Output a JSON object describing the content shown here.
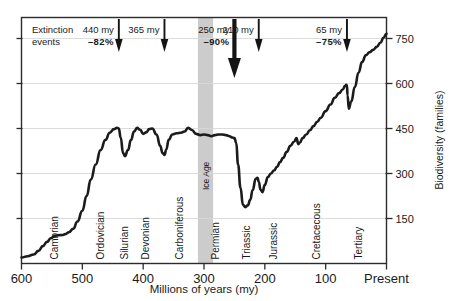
{
  "figure": {
    "name": "biodiversity-vs-geological-time",
    "axis_title_x": "Millions  of  years (my)",
    "axis_title_y": "Biodiversity (families)"
  },
  "annotations": {
    "group_label_line1": "Extinction",
    "group_label_line2": "events",
    "events": [
      {
        "id": "ext-440",
        "my": "440 my",
        "pct": "–82%",
        "x_my": 440,
        "major": false
      },
      {
        "id": "ext-365",
        "my": "365 my",
        "pct": "",
        "x_my": 365,
        "major": false
      },
      {
        "id": "ext-250",
        "my": "250 my",
        "pct": "–90%",
        "x_my": 250,
        "major": true
      },
      {
        "id": "ext-210",
        "my": "210 my",
        "pct": "",
        "x_my": 210,
        "major": false
      },
      {
        "id": "ext-65",
        "my": "65 my",
        "pct": "–75%",
        "x_my": 65,
        "major": false
      }
    ]
  },
  "bands": [
    {
      "id": "ice-age",
      "label": "Ice Age",
      "from_my": 310,
      "to_my": 285,
      "color": "#cccccc"
    }
  ],
  "periods": [
    {
      "label": "Cambrian",
      "x_my": 540
    },
    {
      "label": "Ordovician",
      "x_my": 465
    },
    {
      "label": "Silurian",
      "x_my": 425
    },
    {
      "label": "Devonian",
      "x_my": 390
    },
    {
      "label": "Carboniferous",
      "x_my": 335
    },
    {
      "label": "Permian",
      "x_my": 275
    },
    {
      "label": "Triassic",
      "x_my": 225
    },
    {
      "label": "Jurassic",
      "x_my": 180
    },
    {
      "label": "Cretacecous",
      "x_my": 110
    },
    {
      "label": "Tertiary",
      "x_my": 40
    }
  ],
  "chart_data": {
    "type": "line",
    "title": "",
    "subtitle": "",
    "xlabel": "Millions  of  years (my)",
    "ylabel": "Biodiversity (families)",
    "xlim": [
      600,
      0
    ],
    "ylim": [
      0,
      820
    ],
    "x_reversed": true,
    "grid": "horizontal",
    "legend": "none",
    "xticks": [
      600,
      500,
      400,
      300,
      200,
      100,
      0
    ],
    "xtick_labels": [
      "600",
      "500",
      "400",
      "300",
      "200",
      "100",
      "Present"
    ],
    "yticks": [
      150,
      300,
      450,
      600,
      750
    ],
    "ytick_labels": [
      "150",
      "300",
      "450",
      "600",
      "750"
    ],
    "series": [
      {
        "name": "Biodiversity (families)",
        "color": "#1b1b1b",
        "x": [
          600,
          590,
          580,
          572,
          565,
          558,
          552,
          545,
          540,
          533,
          528,
          522,
          515,
          508,
          500,
          493,
          486,
          478,
          470,
          462,
          455,
          448,
          443,
          440,
          437,
          433,
          430,
          425,
          420,
          415,
          410,
          405,
          400,
          395,
          390,
          385,
          378,
          372,
          368,
          365,
          362,
          358,
          352,
          345,
          338,
          332,
          326,
          320,
          313,
          306,
          300,
          294,
          288,
          282,
          276,
          270,
          264,
          258,
          253,
          250,
          247,
          244,
          240,
          236,
          232,
          228,
          224,
          220,
          215,
          212,
          210,
          207,
          204,
          200,
          195,
          190,
          185,
          180,
          175,
          170,
          164,
          158,
          152,
          148,
          145,
          142,
          138,
          132,
          126,
          120,
          114,
          108,
          100,
          92,
          85,
          78,
          72,
          68,
          66,
          65,
          64,
          62,
          58,
          52,
          46,
          40,
          34,
          28,
          22,
          16,
          10,
          5,
          0
        ],
        "y": [
          20,
          24,
          30,
          42,
          58,
          72,
          84,
          92,
          94,
          95,
          98,
          104,
          116,
          140,
          176,
          225,
          280,
          330,
          378,
          412,
          436,
          448,
          452,
          450,
          420,
          368,
          358,
          378,
          412,
          440,
          452,
          446,
          432,
          437,
          448,
          450,
          430,
          392,
          368,
          362,
          380,
          412,
          430,
          434,
          436,
          440,
          452,
          445,
          432,
          428,
          430,
          428,
          424,
          428,
          430,
          430,
          428,
          424,
          420,
          418,
          402,
          330,
          252,
          196,
          188,
          194,
          212,
          245,
          282,
          286,
          272,
          246,
          238,
          262,
          288,
          300,
          310,
          322,
          338,
          352,
          372,
          392,
          406,
          418,
          398,
          404,
          418,
          430,
          444,
          458,
          472,
          486,
          508,
          530,
          552,
          568,
          580,
          592,
          596,
          594,
          560,
          516,
          540,
          588,
          636,
          672,
          694,
          704,
          712,
          722,
          736,
          752,
          766
        ]
      }
    ]
  }
}
